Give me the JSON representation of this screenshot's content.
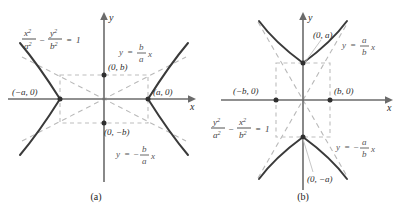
{
  "figure": {
    "type": "hyperbola-diagram-pair",
    "background": "#ffffff",
    "curve_color": "#3a3a3a",
    "asymptote_color": "#bdbdbd",
    "axis_color": "#6b6b6b"
  },
  "panels": [
    {
      "caption": "(a)",
      "orientation": "horizontal",
      "equation": {
        "lhs_num_1": "x",
        "lhs_den_1": "a",
        "lhs_num_2": "y",
        "lhs_den_2": "b",
        "exp": "2",
        "minus": "−",
        "equals": "=",
        "rhs": "1",
        "plain": "x²/a² − y²/b² = 1"
      },
      "axes": {
        "x_label": "x",
        "y_label": "y"
      },
      "points": [
        {
          "name": "left-vertex",
          "label": "(−a, 0)",
          "x": -1,
          "y": 0,
          "dot": true
        },
        {
          "name": "right-vertex",
          "label": "(a, 0)",
          "x": 1,
          "y": 0,
          "dot": true
        },
        {
          "name": "top-b",
          "label": "(0, b)",
          "x": 0,
          "y": 1,
          "dot": true
        },
        {
          "name": "bottom-b",
          "label": "(0, −b)",
          "x": 0,
          "y": -1,
          "dot": true
        }
      ],
      "asymptotes": [
        {
          "name": "positive-slope",
          "label_y": "y",
          "label_eq": "=",
          "label_num": "b",
          "label_den": "a",
          "label_var": "x",
          "sign": "",
          "plain": "y = (b/a)x"
        },
        {
          "name": "negative-slope",
          "label_y": "y",
          "label_eq": "=",
          "label_num": "b",
          "label_den": "a",
          "label_var": "x",
          "sign": "−",
          "plain": "y = −(b/a)x"
        }
      ]
    },
    {
      "caption": "(b)",
      "orientation": "vertical",
      "equation": {
        "lhs_num_1": "y",
        "lhs_den_1": "a",
        "lhs_num_2": "x",
        "lhs_den_2": "b",
        "exp": "2",
        "minus": "−",
        "equals": "=",
        "rhs": "1",
        "plain": "y²/a² − x²/b² = 1"
      },
      "axes": {
        "x_label": "x",
        "y_label": "y"
      },
      "points": [
        {
          "name": "left-b",
          "label": "(−b, 0)",
          "x": -1,
          "y": 0,
          "dot": true
        },
        {
          "name": "right-b",
          "label": "(b, 0)",
          "x": 1,
          "y": 0,
          "dot": true
        },
        {
          "name": "top-vertex",
          "label": "(0, a)",
          "x": 0,
          "y": 1,
          "dot": true
        },
        {
          "name": "bottom-vertex",
          "label": "(0, −a)",
          "x": 0,
          "y": -1,
          "dot": true
        }
      ],
      "asymptotes": [
        {
          "name": "positive-slope",
          "label_y": "y",
          "label_eq": "=",
          "label_num": "a",
          "label_den": "b",
          "label_var": "x",
          "sign": "",
          "plain": "y = (a/b)x"
        },
        {
          "name": "negative-slope",
          "label_y": "y",
          "label_eq": "=",
          "label_num": "a",
          "label_den": "b",
          "label_var": "x",
          "sign": "−",
          "plain": "y = −(a/b)x"
        }
      ]
    }
  ]
}
